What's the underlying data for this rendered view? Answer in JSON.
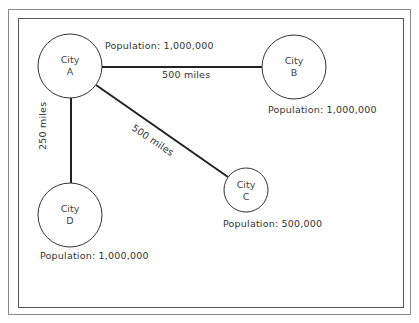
{
  "diagram": {
    "cities": [
      {
        "id": "A",
        "name": "City",
        "letter": "A",
        "population_label": "Population: 1,000,000",
        "cx": 70,
        "cy": 66,
        "r": 32
      },
      {
        "id": "B",
        "name": "City",
        "letter": "B",
        "population_label": "Population: 1,000,000",
        "cx": 294,
        "cy": 67,
        "r": 32
      },
      {
        "id": "C",
        "name": "City",
        "letter": "C",
        "population_label": "Population: 500,000",
        "cx": 246,
        "cy": 190,
        "r": 22
      },
      {
        "id": "D",
        "name": "City",
        "letter": "D",
        "population_label": "Population: 1,000,000",
        "cx": 70,
        "cy": 215,
        "r": 32
      }
    ],
    "connections": [
      {
        "from": "A",
        "to": "B",
        "distance_label": "500 miles"
      },
      {
        "from": "A",
        "to": "C",
        "distance_label": "500 miles"
      },
      {
        "from": "A",
        "to": "D",
        "distance_label": "250 miles"
      }
    ],
    "colors": {
      "line": "#222222",
      "circle": "#333333",
      "border": "#666666"
    }
  }
}
